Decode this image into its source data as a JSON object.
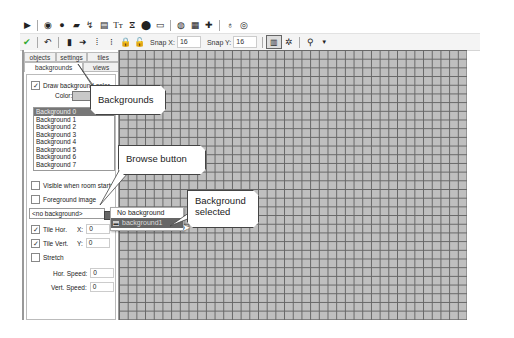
{
  "toolbar_top": {
    "icons": [
      "play-icon",
      "sprite-icon",
      "sound-icon",
      "background-icon",
      "path-icon",
      "script-icon",
      "font-icon",
      "timeline-icon",
      "object-icon",
      "room-icon",
      "game-info-icon",
      "global-settings-icon",
      "extension-icon",
      "help-icon",
      "about-icon"
    ]
  },
  "toolbar_room": {
    "icons": [
      "confirm-icon",
      "undo-icon",
      "clear-icon",
      "shift-icon",
      "sort-x-icon",
      "sort-y-icon",
      "lock-icon",
      "unlock-icon"
    ],
    "snap_x_label": "Snap X:",
    "snap_x_value": "16",
    "snap_y_label": "Snap Y:",
    "snap_y_value": "16"
  },
  "tabs": {
    "row1": [
      "objects",
      "settings",
      "tiles"
    ],
    "row2": [
      "backgrounds",
      "views"
    ],
    "active": "backgrounds"
  },
  "panel": {
    "draw_bg_color_label": "Draw background color",
    "draw_bg_color_checked": true,
    "color_label": "Color:",
    "color_value": "#c8c8c8",
    "backgrounds": [
      "Background 0",
      "Background 1",
      "Background 2",
      "Background 3",
      "Background 4",
      "Background 5",
      "Background 6",
      "Background 7"
    ],
    "selected_index": 0,
    "visible_label": "Visible when room starts",
    "foreground_label": "Foreground image",
    "bg_select_value": "<no background>",
    "tile_hor_label": "Tile Hor.",
    "tile_vert_label": "Tile Vert.",
    "x_label": "X:",
    "x_value": "0",
    "y_label": "Y:",
    "y_value": "0",
    "stretch_label": "Stretch",
    "hor_speed_label": "Hor. Speed:",
    "hor_speed_value": "0",
    "vert_speed_label": "Vert. Speed:",
    "vert_speed_value": "0"
  },
  "dropdown_menu": {
    "items": [
      "No background",
      "background1"
    ],
    "highlighted": "background1"
  },
  "callouts": {
    "backgrounds_tab": "Backgrounds tab",
    "browse_button": "Browse button",
    "background_selected_1": "Background",
    "background_selected_2": "selected"
  }
}
